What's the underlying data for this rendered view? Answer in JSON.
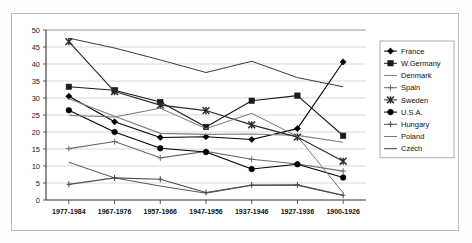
{
  "chart_data": {
    "type": "line",
    "title": "",
    "xlabel": "",
    "ylabel": "",
    "ylim": [
      0,
      50
    ],
    "ytick_step": 5,
    "grid": true,
    "legend_position": "right",
    "categories": [
      "1977-1984",
      "1967-1976",
      "1957-1966",
      "1947-1956",
      "1937-1946",
      "1927-1936",
      "1900-1926"
    ],
    "yticks": [
      "0",
      "5",
      "10",
      "15",
      "20",
      "25",
      "30",
      "35",
      "40",
      "45",
      "50"
    ],
    "series": [
      {
        "name": "France",
        "marker": "diamond",
        "color": "#000000",
        "values": [
          30.5,
          23.0,
          18.4,
          18.6,
          17.8,
          21.0,
          40.6
        ]
      },
      {
        "name": "W.Germany",
        "marker": "square",
        "color": "#1a1a1a",
        "values": [
          33.3,
          32.3,
          28.8,
          21.5,
          29.2,
          30.7,
          18.9
        ]
      },
      {
        "name": "Denmark",
        "marker": "dash",
        "color": "#808080",
        "values": [
          29.8,
          24.6,
          19.6,
          19.3,
          19.4,
          19.0,
          17.0
        ]
      },
      {
        "name": "Spain",
        "marker": "plus",
        "color": "#6b6b6b",
        "values": [
          15.1,
          17.2,
          12.4,
          14.3,
          12.0,
          10.6,
          8.5
        ]
      },
      {
        "name": "Sweden",
        "marker": "star",
        "color": "#2a2a2a",
        "values": [
          46.6,
          31.9,
          27.9,
          26.3,
          22.1,
          18.5,
          11.4
        ]
      },
      {
        "name": "U.S.A.",
        "marker": "circle",
        "color": "#000000",
        "values": [
          26.4,
          20.0,
          15.2,
          14.1,
          9.1,
          10.5,
          6.6
        ]
      },
      {
        "name": "Hungary",
        "marker": "bar",
        "color": "#4d4d4d",
        "values": [
          4.6,
          6.5,
          6.1,
          2.2,
          4.4,
          4.5,
          1.4
        ]
      },
      {
        "name": "Poland",
        "marker": "none",
        "color": "#777777",
        "values": [
          24.9,
          24.4,
          27.0,
          21.0,
          25.5,
          18.7,
          2.1
        ]
      },
      {
        "name": "Czech",
        "marker": "none",
        "color": "#3a3a3a",
        "values": [
          47.6,
          44.7,
          41.2,
          37.5,
          40.8,
          36.0,
          33.3
        ]
      }
    ],
    "extra_lines": [
      {
        "name": "Hungary-lower",
        "color": "#555555",
        "values": [
          11.1,
          6.5,
          4.1,
          2.0,
          4.3,
          4.3,
          1.3
        ]
      }
    ]
  },
  "legend": {
    "items": [
      {
        "label": "France"
      },
      {
        "label": "W.Germany"
      },
      {
        "label": "Denmark"
      },
      {
        "label": "Spain"
      },
      {
        "label": "Sweden"
      },
      {
        "label": "U.S.A."
      },
      {
        "label": "Hungary"
      },
      {
        "label": "Poland"
      },
      {
        "label": "Czech"
      }
    ]
  }
}
